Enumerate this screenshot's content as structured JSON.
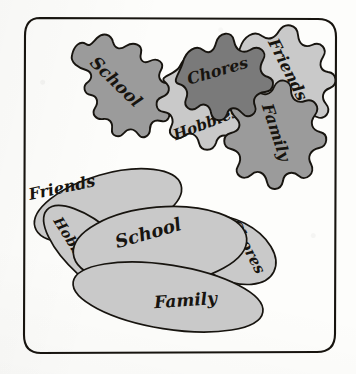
{
  "figure": {
    "frame": {
      "name": "rounded rectangle border"
    }
  },
  "palette": {
    "paper": "#fdfdfb",
    "ink": "#17140f",
    "tint_dark": "#7a7a7a",
    "tint_medium": "#9b9b9b",
    "tint_light": "#c9c9c9"
  },
  "clusters": [
    {
      "id": "top-cluster",
      "name": "separated irregular blobs",
      "blobs": [
        {
          "id": "top-school",
          "label": "School",
          "tint": "tint_medium"
        },
        {
          "id": "top-chores",
          "label": "Chores",
          "tint": "tint_dark"
        },
        {
          "id": "top-friends",
          "label": "Friends",
          "tint": "tint_light"
        },
        {
          "id": "top-hobbies",
          "label": "Hobbies",
          "tint": "tint_light"
        },
        {
          "id": "top-family",
          "label": "Family",
          "tint": "tint_medium"
        }
      ]
    },
    {
      "id": "bottom-cluster",
      "name": "overlapping smooth ellipses",
      "blobs": [
        {
          "id": "bot-friends",
          "label": "Friends",
          "tint": "tint_light"
        },
        {
          "id": "bot-hobbies",
          "label": "Hobbies",
          "tint": "tint_light"
        },
        {
          "id": "bot-school",
          "label": "School",
          "tint": "tint_light"
        },
        {
          "id": "bot-chores",
          "label": "Chores",
          "tint": "tint_light"
        },
        {
          "id": "bot-family",
          "label": "Family",
          "tint": "tint_light"
        }
      ]
    }
  ]
}
